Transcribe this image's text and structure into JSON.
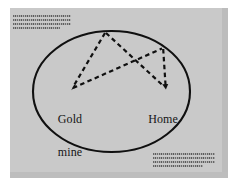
{
  "figure": {
    "name": "treasure-map-diagram",
    "page_background_color": "#c9c9c9",
    "ink_color": "#111111",
    "description_type": "hand-drawn map sketch on a gray page"
  },
  "map": {
    "boundary_shape": "ellipse",
    "labels": [
      {
        "id": "gold-mine",
        "line1": "Gold",
        "line2": "mine",
        "text": "Gold mine"
      },
      {
        "id": "home",
        "line1": "Home",
        "line2": "",
        "text": "Home"
      }
    ],
    "route": {
      "style": "dashed",
      "arrowheads": [
        "gold-mine",
        "home"
      ],
      "waypoints": [
        {
          "id": "gold-mine",
          "x": 71,
          "y": 89
        },
        {
          "id": "north-peak",
          "x": 105,
          "y": 32
        },
        {
          "id": "home",
          "x": 165,
          "y": 88
        },
        {
          "id": "east-ridge",
          "x": 163,
          "y": 48
        }
      ]
    }
  },
  "annotations": {
    "top_left_text_block": {
      "legible": false,
      "line_count": 4,
      "rendered_as": "illegible wavy text lines"
    },
    "bottom_right_text_block": {
      "legible": false,
      "line_count": 4,
      "rendered_as": "illegible wavy text lines"
    }
  }
}
